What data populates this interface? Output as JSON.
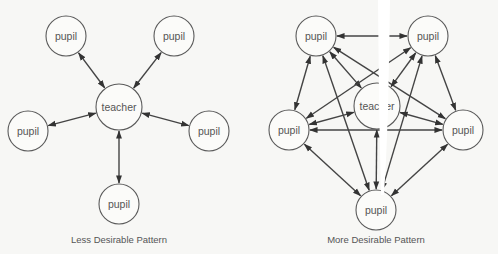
{
  "diagrams": [
    {
      "id": "less",
      "caption": "Less Desirable Pattern",
      "caption_pos": [
        119,
        243
      ],
      "nodes": [
        {
          "id": "t",
          "label": "teacher",
          "x": 119,
          "y": 107,
          "r": 23
        },
        {
          "id": "p1",
          "label": "pupil",
          "x": 66,
          "y": 36,
          "r": 20
        },
        {
          "id": "p2",
          "label": "pupil",
          "x": 174,
          "y": 36,
          "r": 20
        },
        {
          "id": "p3",
          "label": "pupil",
          "x": 28,
          "y": 131,
          "r": 20
        },
        {
          "id": "p4",
          "label": "pupil",
          "x": 209,
          "y": 131,
          "r": 20
        },
        {
          "id": "p5",
          "label": "pupil",
          "x": 119,
          "y": 204,
          "r": 20
        }
      ],
      "edges": [
        [
          "t",
          "p1"
        ],
        [
          "t",
          "p2"
        ],
        [
          "t",
          "p3"
        ],
        [
          "t",
          "p4"
        ],
        [
          "t",
          "p5"
        ]
      ]
    },
    {
      "id": "more",
      "caption": "More Desirable Pattern",
      "caption_pos": [
        376,
        243
      ],
      "nodes": [
        {
          "id": "t",
          "label": "teacher",
          "x": 377,
          "y": 106,
          "r": 23
        },
        {
          "id": "p1",
          "label": "pupil",
          "x": 316,
          "y": 36,
          "r": 20
        },
        {
          "id": "p2",
          "label": "pupil",
          "x": 428,
          "y": 36,
          "r": 20
        },
        {
          "id": "p3",
          "label": "pupil",
          "x": 289,
          "y": 130,
          "r": 20
        },
        {
          "id": "p4",
          "label": "pupil",
          "x": 463,
          "y": 130,
          "r": 20
        },
        {
          "id": "p5",
          "label": "pupil",
          "x": 376,
          "y": 210,
          "r": 20
        }
      ],
      "edges": [
        [
          "p1",
          "p2"
        ],
        [
          "p1",
          "p3"
        ],
        [
          "p1",
          "p4"
        ],
        [
          "p1",
          "p5"
        ],
        [
          "p1",
          "t"
        ],
        [
          "p2",
          "p3"
        ],
        [
          "p2",
          "p4"
        ],
        [
          "p2",
          "p5"
        ],
        [
          "p2",
          "t"
        ],
        [
          "p3",
          "p4"
        ],
        [
          "p3",
          "p5"
        ],
        [
          "p3",
          "t"
        ],
        [
          "p4",
          "p5"
        ],
        [
          "p4",
          "t"
        ],
        [
          "p5",
          "t"
        ]
      ],
      "scan_artifact": "vertical white tear strip obscuring part of teacher label"
    }
  ]
}
